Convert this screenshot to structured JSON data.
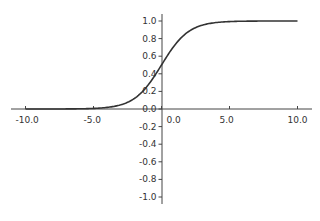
{
  "chart_data": {
    "type": "line",
    "title": "",
    "xlabel": "",
    "ylabel": "",
    "xlim": [
      -11,
      11
    ],
    "ylim": [
      -1.1,
      1.1
    ],
    "grid": false,
    "legend": null,
    "series": [
      {
        "name": "sigmoid",
        "function": "1/(1+exp(-x))",
        "x": [
          -10,
          -8,
          -6,
          -5,
          -4,
          -3,
          -2,
          -1,
          0,
          1,
          2,
          3,
          4,
          5,
          6,
          8,
          10
        ],
        "y": [
          0.0,
          0.0003,
          0.0025,
          0.0067,
          0.018,
          0.047,
          0.119,
          0.269,
          0.5,
          0.731,
          0.881,
          0.953,
          0.982,
          0.993,
          0.9975,
          0.9997,
          1.0
        ],
        "color": "#333333"
      }
    ],
    "x_ticks": [
      "-10.0",
      "-5.0",
      "0.0",
      "5.0",
      "10.0"
    ],
    "y_ticks": [
      "1.0",
      "0.8",
      "0.6",
      "0.4",
      "0.2",
      "0.0",
      "-0.2",
      "-0.4",
      "-0.6",
      "-0.8",
      "-1.0"
    ],
    "x_tick_values": [
      -10,
      -5,
      0,
      5,
      10
    ],
    "y_tick_values": [
      1.0,
      0.8,
      0.6,
      0.4,
      0.2,
      0.0,
      -0.2,
      -0.4,
      -0.6,
      -0.8,
      -1.0
    ],
    "axes_style": "centered spines at origin"
  }
}
